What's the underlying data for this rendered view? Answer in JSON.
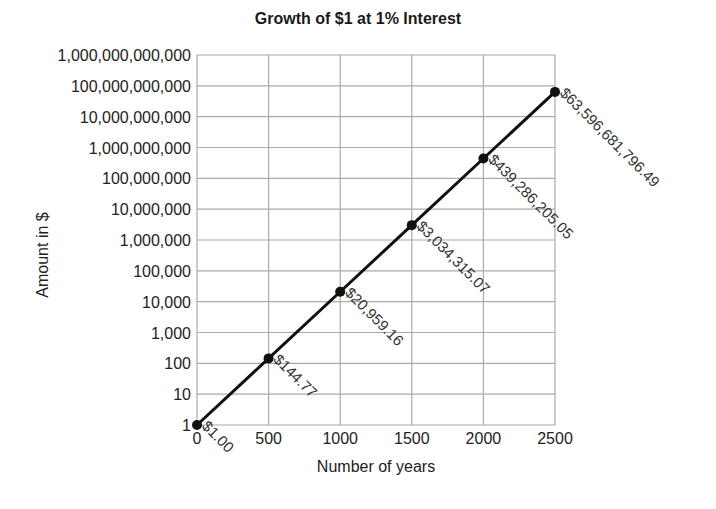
{
  "chart_data": {
    "type": "line",
    "title": "Growth of $1 at 1% Interest",
    "xlabel": "Number of years",
    "ylabel": "Amount in $",
    "yscale": "log",
    "xlim": [
      0,
      2500
    ],
    "ylim": [
      1,
      1000000000000
    ],
    "grid": true,
    "legend": null,
    "x_ticks": [
      "0",
      "500",
      "1000",
      "1500",
      "2000",
      "2500"
    ],
    "y_ticks": [
      "1",
      "10",
      "100",
      "1,000",
      "10,000",
      "100,000",
      "1,000,000",
      "10,000,000",
      "100,000,000",
      "1,000,000,000",
      "10,000,000,000",
      "100,000,000,000",
      "1,000,000,000,000"
    ],
    "series": [
      {
        "name": "Growth of $1",
        "x": [
          0,
          500,
          1000,
          1500,
          2000,
          2500
        ],
        "values": [
          1.0,
          144.77,
          20959.16,
          3034315.07,
          439286205.05,
          63596681796.49
        ],
        "labels": [
          "$1.00",
          "$144.77",
          "$20,959.16",
          "$3,034,315.07",
          "$439,286,205.05",
          "$63,596,681,796.49"
        ]
      }
    ]
  },
  "caption_fragment": "... d with ... diagr ... d"
}
